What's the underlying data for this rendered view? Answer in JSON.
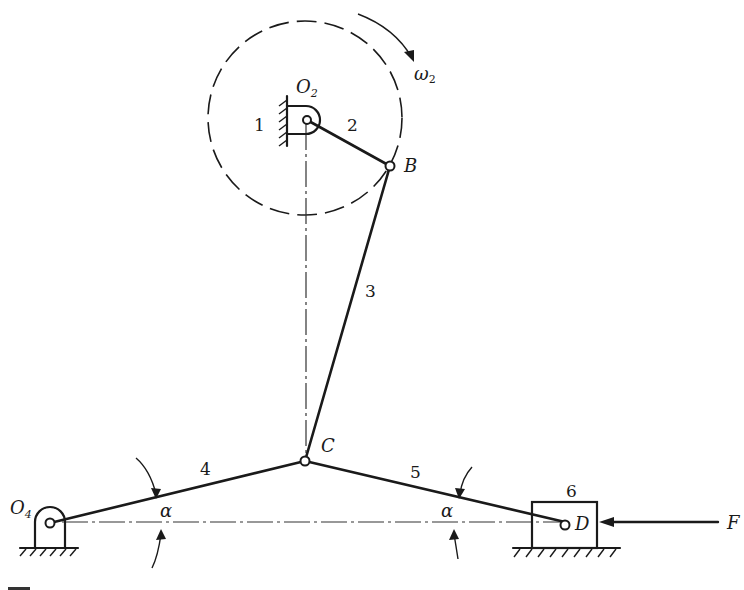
{
  "diagram": {
    "type": "planar linkage (toggle/knee-joint press mechanism)",
    "links": [
      {
        "id": "1",
        "label": "1",
        "role": "frame (ground at O2)"
      },
      {
        "id": "2",
        "label": "2",
        "role": "crank O2-B"
      },
      {
        "id": "3",
        "label": "3",
        "role": "coupler B-C"
      },
      {
        "id": "4",
        "label": "4",
        "role": "link O4-C"
      },
      {
        "id": "5",
        "label": "5",
        "role": "link C-D"
      },
      {
        "id": "6",
        "label": "6",
        "role": "slider at D"
      }
    ],
    "points": {
      "O2": {
        "label": "O",
        "sub": "2"
      },
      "O4": {
        "label": "O",
        "sub": "4"
      },
      "B": {
        "label": "B"
      },
      "C": {
        "label": "C"
      },
      "D": {
        "label": "D"
      }
    },
    "angular_velocity": {
      "label": "ω",
      "sub": "2",
      "direction": "clockwise"
    },
    "force": {
      "label": "F",
      "direction": "leftward on slider 6"
    },
    "angles": [
      {
        "label": "α",
        "between": "link 4 and horizontal"
      },
      {
        "label": "α",
        "between": "link 5 and horizontal"
      }
    ]
  }
}
